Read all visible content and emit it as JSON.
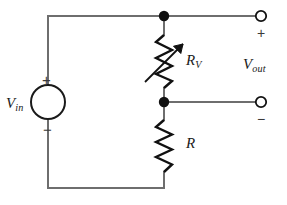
{
  "figure": {
    "type": "circuit-schematic",
    "width": 287,
    "height": 205,
    "background_color": "#ffffff",
    "wire_color": "#6e6e6e",
    "component_color": "#1a1a1a"
  },
  "labels": {
    "vin": {
      "base": "V",
      "sub": "in"
    },
    "vout": {
      "base": "V",
      "sub": "out"
    },
    "rv": {
      "base": "R",
      "sub": "V"
    },
    "r": {
      "base": "R",
      "sub": ""
    }
  },
  "polarity": {
    "source_plus": "+",
    "source_minus": "−",
    "output_plus": "+",
    "output_minus": "−"
  },
  "components": [
    {
      "id": "voltage-source",
      "kind": "circle-source",
      "label": "V_in",
      "cx": 48,
      "cy": 102,
      "r": 17
    },
    {
      "id": "variable-resistor",
      "kind": "resistor-variable",
      "label": "R_V",
      "x": 164,
      "y_top": 35,
      "y_bottom": 88
    },
    {
      "id": "fixed-resistor",
      "kind": "resistor",
      "label": "R",
      "x": 164,
      "y_top": 120,
      "y_bottom": 172
    }
  ],
  "nodes": [
    {
      "id": "top-junction",
      "x": 164,
      "y": 16
    },
    {
      "id": "mid-junction",
      "x": 164,
      "y": 102
    }
  ],
  "terminals": [
    {
      "id": "output-positive",
      "x": 261,
      "y": 16,
      "r": 5,
      "sign": "+"
    },
    {
      "id": "output-negative",
      "x": 261,
      "y": 102,
      "r": 5,
      "sign": "−"
    }
  ]
}
